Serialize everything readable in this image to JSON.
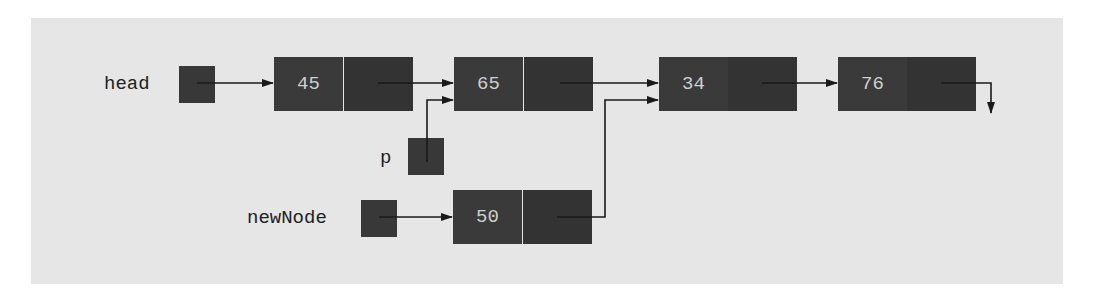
{
  "diagram": {
    "colors": {
      "background": "#e6e6e6",
      "node_fill": "#3a3a3a",
      "node_text": "#cfcfcf",
      "arrow": "#1a1a1a",
      "label_text": "#222222"
    },
    "pointers": [
      {
        "id": "head",
        "label": "head"
      },
      {
        "id": "p",
        "label": "p"
      },
      {
        "id": "newNode",
        "label": "newNode"
      }
    ],
    "list_nodes": [
      {
        "info": "45",
        "next": "65"
      },
      {
        "info": "65",
        "next": "34"
      },
      {
        "info": "34",
        "next": "76"
      },
      {
        "info": "76",
        "next": "null"
      }
    ],
    "new_node": {
      "info": "50",
      "next": "34"
    },
    "edges": [
      {
        "from": "head",
        "to": "45"
      },
      {
        "from": "45",
        "to": "65"
      },
      {
        "from": "p",
        "to": "65"
      },
      {
        "from": "65",
        "to": "34"
      },
      {
        "from": "34",
        "to": "76"
      },
      {
        "from": "76",
        "to": "null"
      },
      {
        "from": "newNode",
        "to": "50"
      },
      {
        "from": "50",
        "to": "34"
      }
    ]
  }
}
